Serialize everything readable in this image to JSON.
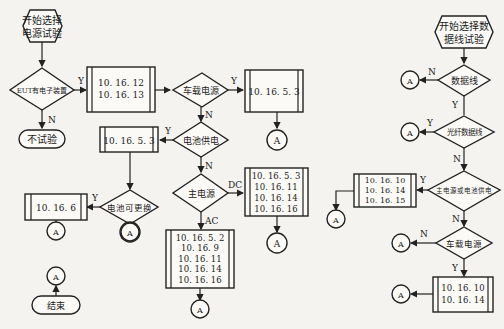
{
  "left_flow": {
    "start": {
      "line1": "开始选择",
      "line2": "电源试验"
    },
    "decision_eut": "EUT有电子装置",
    "no_test": "不试验",
    "box_12_13": [
      "10. 16. 12",
      "10. 16. 13"
    ],
    "decision_vehicle": "车载电源",
    "box_vehicle": "10. 16. 5. 3",
    "decision_battery": "电池供电",
    "box_battery": "10. 16. 5. 3",
    "decision_replaceable": "电池可更换",
    "box_replaceable": "10. 16. 6",
    "decision_main": "主电源",
    "box_dc": [
      "10. 16. 5. 3",
      "10. 16. 11",
      "10. 16. 14",
      "10. 16. 16"
    ],
    "box_ac": [
      "10. 16. 5. 2",
      "10. 16. 9",
      "10. 16. 11",
      "10. 16. 14",
      "10. 16. 16"
    ],
    "end": "结束"
  },
  "right_flow": {
    "start": {
      "line1": "开始选择数",
      "line2": "据线试验"
    },
    "decision_dataline": "数据线",
    "decision_fiber": "光纤数据线",
    "decision_main_or_battery": "主电源或电池供电",
    "box_main_or_battery": [
      "10. 16. 10",
      "10. 16. 14",
      "10. 16. 15"
    ],
    "decision_vehicle": "车载电源",
    "box_vehicle": [
      "10. 16. 10",
      "10. 16. 14"
    ]
  },
  "labels": {
    "yes": "Y",
    "no": "N",
    "ac": "AC",
    "dc": "DC",
    "connector": "A"
  }
}
